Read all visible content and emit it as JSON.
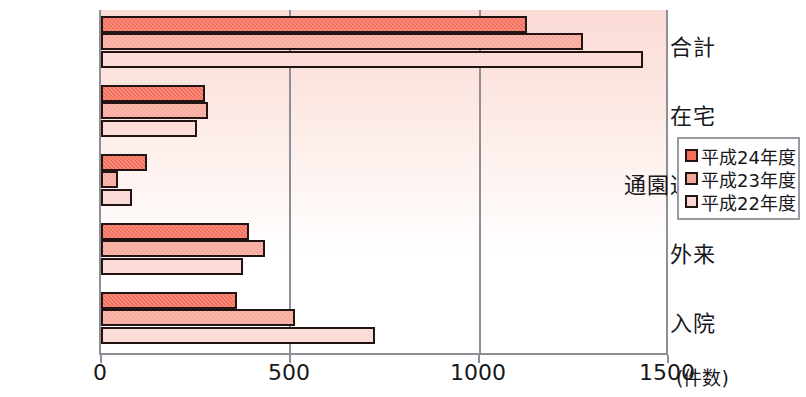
{
  "chart_data": {
    "type": "bar",
    "orientation": "horizontal",
    "title": "",
    "xlabel": "(件数)",
    "ylabel": "",
    "xlim": [
      0,
      1500
    ],
    "xticks": [
      0,
      500,
      1000,
      1500
    ],
    "xtick_labels": [
      "0",
      "500",
      "1000",
      "1500"
    ],
    "x_unit_label": "(件数)",
    "grid": "vertical-at-500-and-1000",
    "legend_position": "right",
    "categories": [
      "合計",
      "在宅",
      "通園通所",
      "外来",
      "入院"
    ],
    "series": [
      {
        "name": "平成24年度",
        "color": "#f4705c",
        "values": [
          1128,
          274,
          122,
          392,
          360
        ]
      },
      {
        "name": "平成23年度",
        "color": "#f7a79a",
        "values": [
          1276,
          284,
          45,
          434,
          513
        ]
      },
      {
        "name": "平成22年度",
        "color": "#fad7d0",
        "values": [
          1434,
          255,
          82,
          376,
          726
        ]
      }
    ]
  },
  "axis": {
    "tick_labels": [
      "0",
      "500",
      "1000",
      "1500"
    ],
    "unit": "(件数)",
    "category_labels": [
      "合計",
      "在宅",
      "通園通所",
      "外来",
      "入院"
    ]
  },
  "legend": {
    "items": [
      {
        "label": "平成24年度",
        "color": "#f4705c"
      },
      {
        "label": "平成23年度",
        "color": "#f7a79a"
      },
      {
        "label": "平成22年度",
        "color": "#fad7d0"
      }
    ]
  },
  "colors": {
    "series_24": "#f4705c",
    "series_23": "#f7a79a",
    "series_22": "#fad7d0",
    "bar_outline": "#231313",
    "axis": "#8e8e96",
    "text": "#17171c",
    "plot_bg_top": "#fbdbd6",
    "plot_bg_bottom": "#ffffff"
  }
}
